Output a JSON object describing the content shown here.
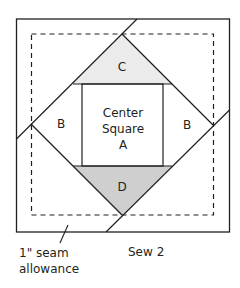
{
  "diagram": {
    "labels": {
      "triangle_top": "C",
      "triangle_bottom": "D",
      "triangle_left": "B",
      "triangle_right": "B",
      "center_line1": "Center",
      "center_line2": "Square",
      "center_line3": "A",
      "seam_line1": "1\" seam",
      "seam_line2": "allowance",
      "step": "Sew 2"
    },
    "colors": {
      "stroke": "#231f20",
      "triangle_c_fill": "#ebebeb",
      "triangle_d_fill": "#cfcfcf",
      "background": "#ffffff"
    }
  }
}
